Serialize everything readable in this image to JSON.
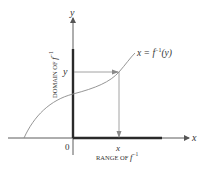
{
  "figure": {
    "x_axis_label": "x",
    "y_axis_label": "y",
    "origin_label": "0",
    "curve_label": {
      "lhs": "x = ",
      "func": "f",
      "sup": "−1",
      "arg": "(y)"
    },
    "point_y_label": "y",
    "point_x_label": "x",
    "domain_label": {
      "text": "DOMAIN OF ",
      "func": "f",
      "sup": "−1"
    },
    "range_label": {
      "text": "RANGE OF ",
      "func": "f",
      "sup": "−1"
    },
    "colors": {
      "axis": "#4a4a4a",
      "thick_bar": "#2a2a2a",
      "curve": "#8a8a8a",
      "arrow": "#8a8a8a",
      "text": "#333333"
    }
  }
}
